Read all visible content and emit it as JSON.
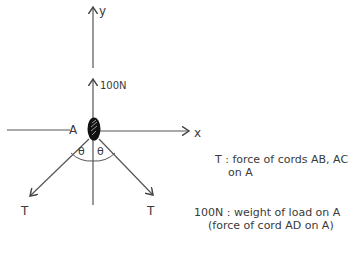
{
  "diagram": {
    "type": "free-body-diagram",
    "axes": {
      "x_label": "x",
      "y_label": "y"
    },
    "point": {
      "label": "A"
    },
    "forces": [
      {
        "id": "weight",
        "label": "100N",
        "direction": "up"
      },
      {
        "id": "tension_left",
        "label": "T",
        "direction": "down-left"
      },
      {
        "id": "tension_right",
        "label": "T",
        "direction": "down-right"
      }
    ],
    "angles": [
      {
        "label": "θ",
        "side": "left"
      },
      {
        "label": "θ",
        "side": "right"
      }
    ]
  },
  "legend": {
    "t_line1": "T : force of cords AB, AC",
    "t_line2": "on A",
    "w_line1": "100N : weight of load on A",
    "w_line2": "(force of cord AD on A)"
  },
  "colors": {
    "ink": "#3a3a3a",
    "node": "#111111",
    "background": "#ffffff"
  }
}
